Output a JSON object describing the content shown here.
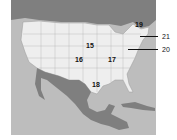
{
  "map": {
    "title": "",
    "region": "North America",
    "colors": {
      "water": "#bdbdbd",
      "us": "#eeeeee",
      "neighbors": "#7f7f7f",
      "borders": "#9a9a9a"
    },
    "labels": [
      {
        "id": "15",
        "text": "15",
        "x": 86,
        "y": 42
      },
      {
        "id": "16",
        "text": "16",
        "x": 75,
        "y": 56
      },
      {
        "id": "17",
        "text": "17",
        "x": 108,
        "y": 56
      },
      {
        "id": "18",
        "text": "18",
        "x": 92,
        "y": 81
      },
      {
        "id": "19",
        "text": "19",
        "x": 135,
        "y": 21
      }
    ],
    "callouts": [
      {
        "id": "21",
        "text": "21",
        "x": 162,
        "y": 33
      },
      {
        "id": "20",
        "text": "20",
        "x": 162,
        "y": 46
      }
    ]
  }
}
